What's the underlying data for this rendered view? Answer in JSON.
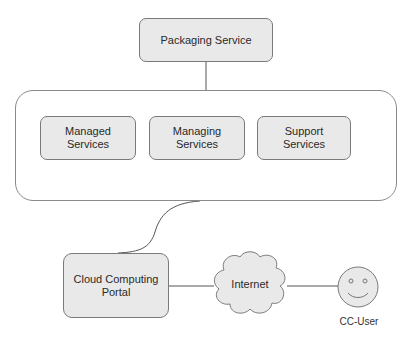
{
  "diagram": {
    "packaging": {
      "label": "Packaging Service"
    },
    "container": {
      "services": [
        {
          "line1": "Managed",
          "line2": "Services"
        },
        {
          "line1": "Managing",
          "line2": "Services"
        },
        {
          "line1": "Support",
          "line2": "Services"
        }
      ]
    },
    "portal": {
      "line1": "Cloud Computing",
      "line2": "Portal"
    },
    "internet": {
      "label": "Internet"
    },
    "user": {
      "label": "CC-User",
      "icon": "smiley-face-icon"
    }
  },
  "colors": {
    "box_fill": "#e9e9e9",
    "border": "#7a7a7a",
    "line": "#555555"
  }
}
